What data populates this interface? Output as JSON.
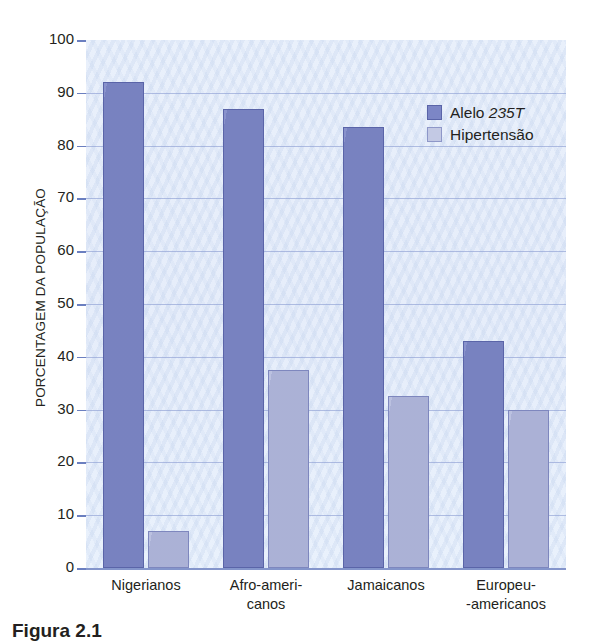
{
  "chart_data": {
    "type": "bar",
    "title": "",
    "xlabel": "",
    "ylabel": "PORCENTAGEM DA POPULAÇÃO",
    "ylim": [
      0,
      100
    ],
    "ytick_step": 10,
    "yticks": [
      100,
      90,
      80,
      70,
      60,
      50,
      40,
      30,
      20,
      10,
      0
    ],
    "grid": true,
    "legend_position": "top-right",
    "categories": [
      "Nigerianos",
      "Afro-ameri-\ncanos",
      "Jamaicanos",
      "Europeu-\n-americanos"
    ],
    "series": [
      {
        "name": "Alelo 235T",
        "name_plain": "Alelo ",
        "name_italic": "235T",
        "color": "#7c86c6",
        "values": [
          92,
          87,
          83.5,
          43
        ]
      },
      {
        "name": "Hipertensão",
        "color": "#aeb5da",
        "values": [
          7,
          37.5,
          32.5,
          30
        ]
      }
    ]
  },
  "figure": {
    "caption": "Figura  2.1",
    "plot_background": "#e8effa",
    "gridline_color": "#8f9fd4",
    "axis_color": "#7d8fc8",
    "text_color": "#231f20"
  }
}
